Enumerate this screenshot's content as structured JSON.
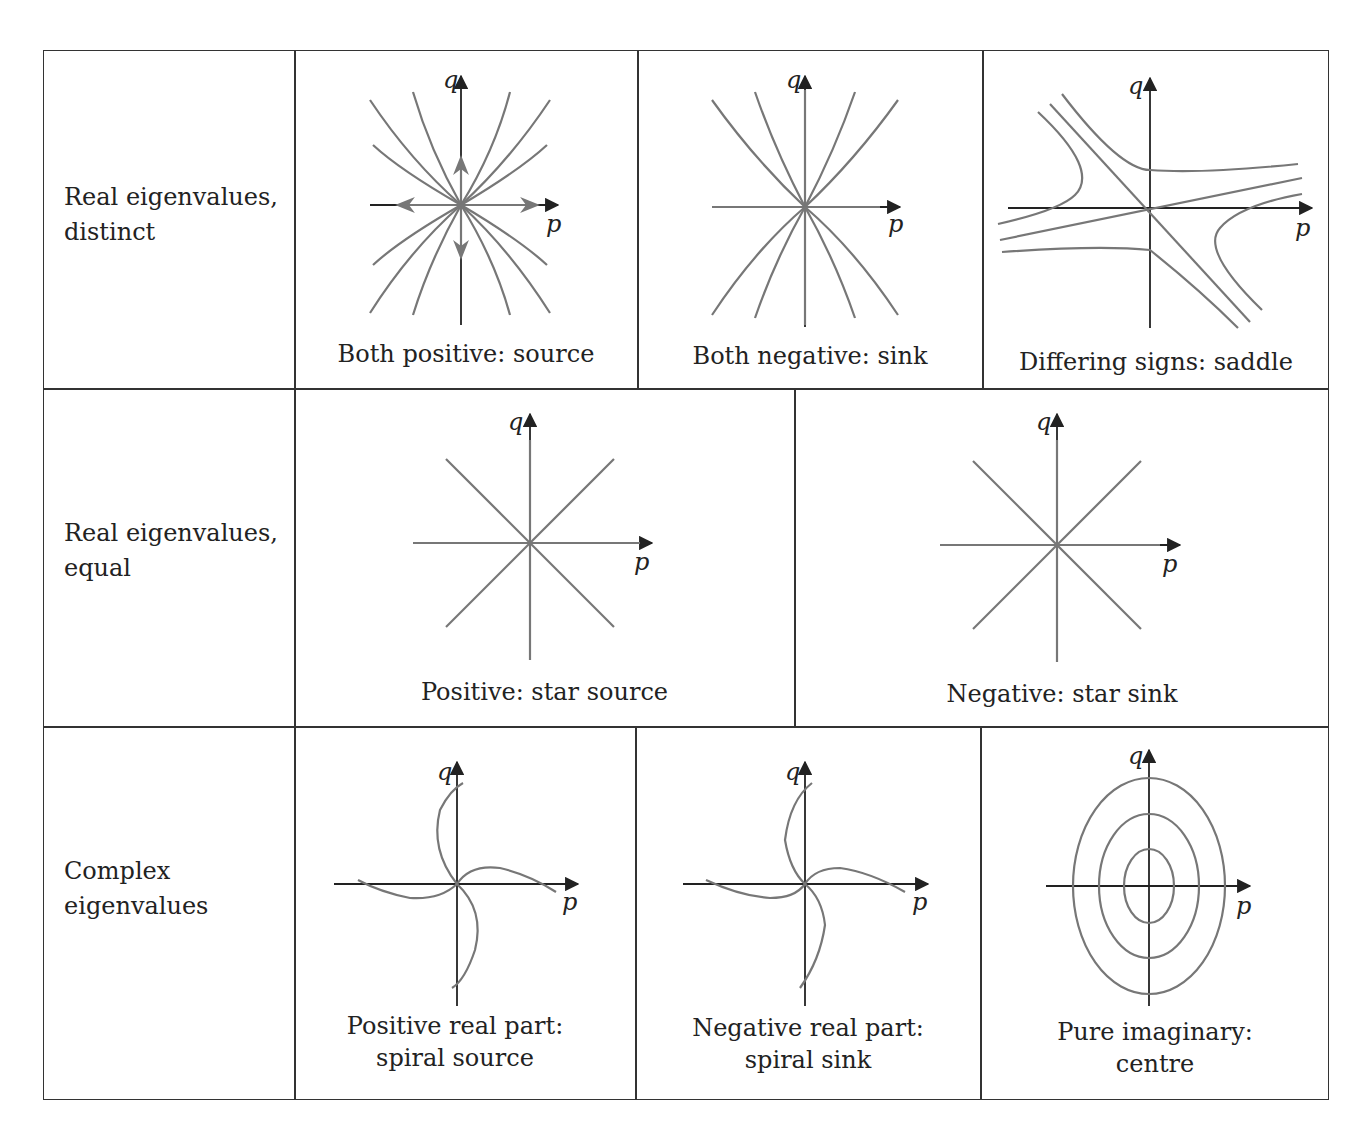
{
  "table": {
    "rows": [
      {
        "label": "Real eigenvalues,\ndistinct",
        "cells": [
          {
            "caption": "Both positive: source",
            "type": "node-source"
          },
          {
            "caption": "Both negative: sink",
            "type": "node-sink"
          },
          {
            "caption": "Differing signs: saddle",
            "type": "saddle"
          }
        ]
      },
      {
        "label": "Real eigenvalues,\nequal",
        "cells": [
          {
            "caption": "Positive: star source",
            "type": "star-source"
          },
          {
            "caption": "Negative: star sink",
            "type": "star-sink"
          }
        ]
      },
      {
        "label": "Complex\neigenvalues",
        "cells": [
          {
            "caption": "Positive real part:\nspiral source",
            "type": "spiral-source"
          },
          {
            "caption": "Negative real part:\nspiral sink",
            "type": "spiral-sink"
          },
          {
            "caption": "Pure imaginary:\ncentre",
            "type": "centre"
          }
        ]
      }
    ]
  },
  "axes": {
    "x": "p",
    "y": "q"
  },
  "colors": {
    "axis": "#222222",
    "trajectory": "#777777",
    "border": "#333333"
  }
}
